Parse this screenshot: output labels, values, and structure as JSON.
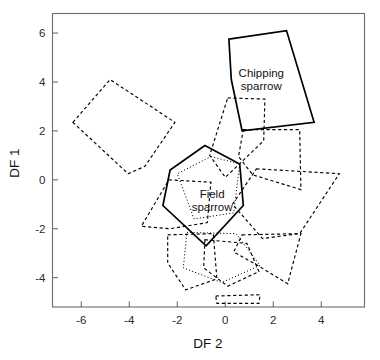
{
  "chart_data": {
    "type": "scatter",
    "title": "",
    "subtitle": "",
    "xlabel": "DF 2",
    "ylabel": "DF 1",
    "xlim": [
      -7.2,
      5.8
    ],
    "ylim": [
      -5.2,
      6.8
    ],
    "xticks": [
      -6,
      -4,
      -2,
      0,
      2,
      4
    ],
    "xticklabels": [
      "-6",
      "-4",
      "-2",
      "0",
      "2",
      "4"
    ],
    "yticks": [
      6,
      4,
      2,
      0,
      -2,
      -4
    ],
    "yticklabels": [
      "6",
      "4",
      "2",
      "0",
      "-2",
      "-4"
    ],
    "grid": false,
    "legend": "none",
    "plot_style": "convex-hull-polygons",
    "annotations": [
      {
        "text_line1": "Chipping",
        "text_line2": "sparrow",
        "x": 1.5,
        "y": 4.2
      },
      {
        "text_line1": "Field",
        "text_line2": "sparrow",
        "x": -0.55,
        "y": -0.75
      }
    ],
    "series": [
      {
        "name": "Chipping sparrow",
        "style": "solid",
        "labelled": true,
        "points": [
          [
            0.15,
            5.75
          ],
          [
            2.55,
            6.1
          ],
          [
            3.7,
            2.35
          ],
          [
            0.7,
            2.0
          ],
          [
            0.25,
            4.1
          ]
        ]
      },
      {
        "name": "Field sparrow",
        "style": "solid",
        "labelled": true,
        "points": [
          [
            -0.85,
            1.4
          ],
          [
            0.6,
            0.65
          ],
          [
            0.75,
            -1.05
          ],
          [
            -0.8,
            -2.7
          ],
          [
            -2.6,
            -1.05
          ],
          [
            -2.3,
            0.4
          ]
        ]
      },
      {
        "name": "hull-dashed-left",
        "style": "dashed",
        "labelled": false,
        "points": [
          [
            -6.35,
            2.35
          ],
          [
            -4.8,
            4.1
          ],
          [
            -2.1,
            2.35
          ],
          [
            -3.35,
            0.55
          ],
          [
            -4.05,
            0.25
          ]
        ]
      },
      {
        "name": "hull-dashed-upper-mid",
        "style": "dashed",
        "labelled": false,
        "points": [
          [
            0.1,
            3.35
          ],
          [
            1.65,
            3.3
          ],
          [
            1.6,
            1.6
          ],
          [
            0.0,
            0.1
          ],
          [
            -0.65,
            1.0
          ]
        ]
      },
      {
        "name": "hull-dashed-right-upper",
        "style": "dashed",
        "labelled": false,
        "points": [
          [
            0.75,
            2.05
          ],
          [
            3.1,
            2.05
          ],
          [
            3.15,
            -0.4
          ],
          [
            1.15,
            0.2
          ],
          [
            0.55,
            0.95
          ]
        ]
      },
      {
        "name": "hull-dashed-right-lower",
        "style": "dashed",
        "labelled": false,
        "points": [
          [
            1.3,
            0.45
          ],
          [
            4.75,
            0.25
          ],
          [
            3.1,
            -2.2
          ],
          [
            1.55,
            -2.4
          ],
          [
            0.3,
            -1.0
          ]
        ]
      },
      {
        "name": "hull-dashed-far-right-low",
        "style": "dashed",
        "labelled": false,
        "points": [
          [
            0.7,
            -2.25
          ],
          [
            3.15,
            -2.2
          ],
          [
            2.6,
            -4.25
          ],
          [
            1.35,
            -3.5
          ],
          [
            0.35,
            -2.95
          ]
        ]
      },
      {
        "name": "hull-dashed-center-left",
        "style": "dashed",
        "labelled": false,
        "points": [
          [
            -2.35,
            0.0
          ],
          [
            -0.6,
            -0.1
          ],
          [
            -0.75,
            -1.75
          ],
          [
            -2.3,
            -2.0
          ],
          [
            -3.5,
            -1.9
          ]
        ]
      },
      {
        "name": "hull-dashed-lower-left",
        "style": "dashed",
        "labelled": false,
        "points": [
          [
            -2.4,
            -2.25
          ],
          [
            -0.5,
            -2.2
          ],
          [
            -0.35,
            -4.05
          ],
          [
            -1.65,
            -4.5
          ],
          [
            -2.4,
            -3.4
          ]
        ]
      },
      {
        "name": "hull-dashed-lower-mid",
        "style": "dashed",
        "labelled": false,
        "points": [
          [
            -0.85,
            -2.45
          ],
          [
            0.9,
            -2.6
          ],
          [
            1.4,
            -3.75
          ],
          [
            0.1,
            -4.35
          ],
          [
            -0.9,
            -3.6
          ]
        ]
      },
      {
        "name": "hull-dashed-sliver-bottom",
        "style": "dashed",
        "labelled": false,
        "points": [
          [
            -0.4,
            -4.75
          ],
          [
            1.45,
            -4.7
          ],
          [
            1.4,
            -5.05
          ],
          [
            -0.35,
            -5.05
          ]
        ]
      },
      {
        "name": "hull-dotted-center",
        "style": "dotted",
        "labelled": false,
        "points": [
          [
            -0.6,
            0.95
          ],
          [
            0.6,
            0.65
          ],
          [
            0.35,
            -1.35
          ],
          [
            -1.3,
            -1.6
          ],
          [
            -2.0,
            0.25
          ]
        ]
      },
      {
        "name": "hull-dotted-lower",
        "style": "dotted",
        "labelled": false,
        "points": [
          [
            -1.6,
            -2.15
          ],
          [
            0.45,
            -2.2
          ],
          [
            1.45,
            -3.5
          ],
          [
            -0.15,
            -4.2
          ],
          [
            -1.75,
            -3.6
          ]
        ]
      }
    ]
  },
  "axes": {
    "y_title": "DF 1",
    "x_title": "DF 2"
  }
}
